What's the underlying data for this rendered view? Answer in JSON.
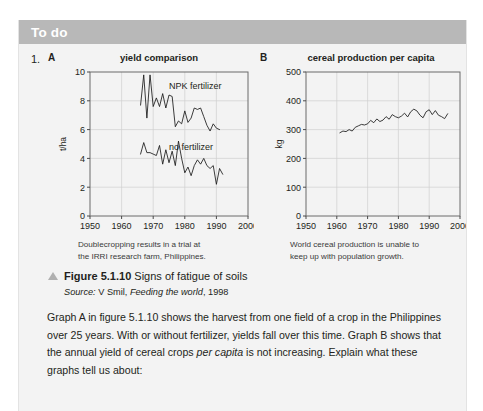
{
  "header": {
    "title": "To do",
    "bar_color": "#b8b8b8"
  },
  "question": {
    "number": "1.",
    "paragraph_part1": "Graph A in figure 5.1.10 shows the harvest from one field of a crop in the Philippines over 25 years. With or without fertilizer, yields fall over this time. Graph B shows that the annual yield of cereal crops ",
    "paragraph_italic": "per capita",
    "paragraph_part2": " is not increasing. Explain what these graphs tell us about:"
  },
  "figure": {
    "marker": "triangle-marker",
    "label": "Figure 5.1.10",
    "title": " Signs of fatigue of soils",
    "source_label": "Source:",
    "source_author": " V Smil, ",
    "source_work": "Feeding the world",
    "source_year": ", 1998"
  },
  "chart_a": {
    "panel_letter": "A",
    "caption_line1": "Doublecropping results in a trial at",
    "caption_line2": "the IRRI research farm, Philippines."
  },
  "chart_b": {
    "panel_letter": "B",
    "caption_line1": "World cereal production is unable to",
    "caption_line2": "keep up with population growth."
  },
  "chart_data": [
    {
      "id": "A",
      "type": "line",
      "title": "yield comparison",
      "xlabel": "",
      "ylabel": "t/ha",
      "xlim": [
        1950,
        2000
      ],
      "ylim": [
        0,
        10
      ],
      "xticks": [
        1950,
        1960,
        1970,
        1980,
        1990,
        2000
      ],
      "yticks": [
        0,
        2,
        4,
        6,
        8,
        10
      ],
      "grid": true,
      "legend": "inline-annotations",
      "annotations": [
        {
          "text": "NPK fertilizer",
          "x": 1975,
          "y": 8.8
        },
        {
          "text": "no fertilizer",
          "x": 1975,
          "y": 4.6
        }
      ],
      "series": [
        {
          "name": "NPK fertilizer",
          "x": [
            1966,
            1967,
            1968,
            1969,
            1970,
            1971,
            1972,
            1973,
            1974,
            1975,
            1976,
            1977,
            1978,
            1979,
            1980,
            1981,
            1982,
            1983,
            1984,
            1985,
            1986,
            1987,
            1988,
            1989,
            1990,
            1991
          ],
          "values": [
            7.7,
            9.8,
            6.8,
            9.8,
            7.6,
            8.2,
            7.6,
            8.5,
            7.5,
            8.4,
            8.3,
            6.2,
            6.6,
            6.4,
            7.3,
            6.5,
            6.8,
            7.5,
            7.4,
            7.5,
            6.9,
            6.3,
            5.9,
            6.4,
            6.1,
            6.0
          ]
        },
        {
          "name": "no fertilizer",
          "x": [
            1966,
            1967,
            1968,
            1969,
            1970,
            1971,
            1972,
            1973,
            1974,
            1975,
            1976,
            1977,
            1978,
            1979,
            1980,
            1981,
            1982,
            1983,
            1984,
            1985,
            1986,
            1987,
            1988,
            1989,
            1990,
            1991
          ],
          "values": [
            4.3,
            5.1,
            4.4,
            4.4,
            4.3,
            4.2,
            4.9,
            3.6,
            4.6,
            3.7,
            4.5,
            3.5,
            5.2,
            4.0,
            3.0,
            3.4,
            2.8,
            3.5,
            3.9,
            3.6,
            4.0,
            3.5,
            3.3,
            3.5,
            2.2,
            3.3,
            2.9
          ]
        }
      ]
    },
    {
      "id": "B",
      "type": "line",
      "title": "cereal production per capita",
      "xlabel": "",
      "ylabel": "kg",
      "xlim": [
        1950,
        2000
      ],
      "ylim": [
        0,
        500
      ],
      "xticks": [
        1950,
        1960,
        1970,
        1980,
        1990,
        2000
      ],
      "yticks": [
        0,
        100,
        200,
        300,
        400,
        500
      ],
      "grid": true,
      "series": [
        {
          "name": "cereal production per capita",
          "x": [
            1961,
            1962,
            1963,
            1964,
            1965,
            1966,
            1967,
            1968,
            1969,
            1970,
            1971,
            1972,
            1973,
            1974,
            1975,
            1976,
            1977,
            1978,
            1979,
            1980,
            1981,
            1982,
            1983,
            1984,
            1985,
            1986,
            1987,
            1988,
            1989,
            1990,
            1991,
            1992,
            1993,
            1994,
            1995,
            1996
          ],
          "values": [
            289,
            295,
            293,
            300,
            295,
            308,
            313,
            318,
            316,
            320,
            332,
            324,
            337,
            328,
            333,
            345,
            336,
            352,
            345,
            341,
            347,
            357,
            344,
            362,
            371,
            365,
            350,
            341,
            362,
            369,
            352,
            366,
            350,
            345,
            338,
            355
          ]
        }
      ]
    }
  ]
}
